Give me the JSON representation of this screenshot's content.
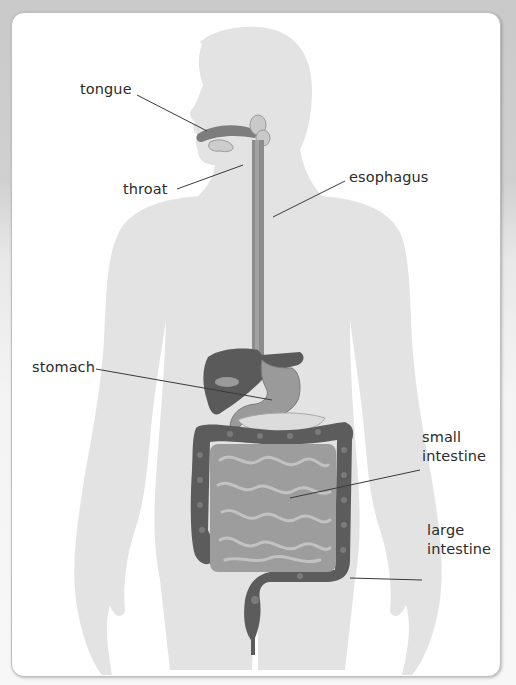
{
  "diagram": {
    "labels": {
      "tongue": "tongue",
      "throat": "throat",
      "esophagus": "esophagus",
      "stomach": "stomach",
      "small_intestine_line1": "small",
      "small_intestine_line2": "intestine",
      "large_intestine_line1": "large",
      "large_intestine_line2": "intestine"
    },
    "colors": {
      "background": "#cacaca",
      "card": "#ffffff",
      "silhouette": "#e3e3e3",
      "organ_dark": "#555555",
      "organ_mid": "#8a8a8a",
      "organ_light": "#b5b5b5",
      "leader_line": "#3a3a3a",
      "label_text": "#2b2b2b"
    }
  }
}
